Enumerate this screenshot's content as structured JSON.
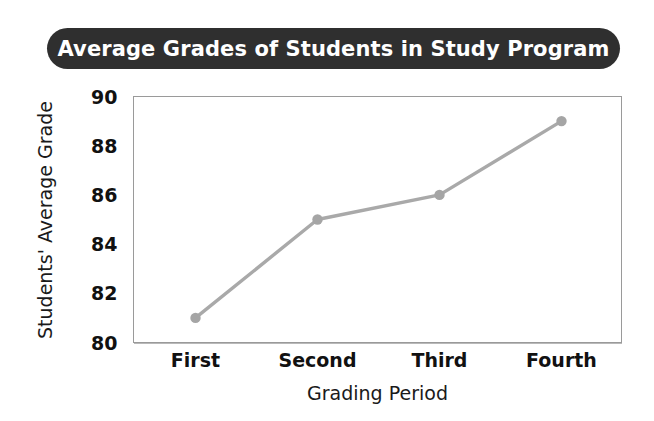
{
  "chart_data": {
    "type": "line",
    "title": "Average Grades of Students in Study Program",
    "xlabel": "Grading Period",
    "ylabel": "Students' Average Grade",
    "categories": [
      "First",
      "Second",
      "Third",
      "Fourth"
    ],
    "values": [
      81,
      85,
      86,
      89
    ],
    "series": [
      {
        "name": "Students' Average Grade",
        "values": [
          81,
          85,
          86,
          89
        ]
      }
    ],
    "ylim": [
      80,
      90
    ],
    "ytick_step": 2,
    "yticks": [
      80,
      82,
      84,
      86,
      88,
      90
    ],
    "ytick_labels": [
      "80",
      "82",
      "84",
      "86",
      "88",
      "90"
    ],
    "grid": true,
    "grid_axis": "both",
    "legend": false,
    "legend_position": "none",
    "markers": true,
    "colors": {
      "line": "#a9a9a9",
      "marker": "#a5a5a5",
      "grid": "#b9b9b9",
      "plot_border": "#9a9a9a",
      "title_banner": "#2f2f2f",
      "title_text": "#ffffff",
      "axis_text": "#111111",
      "background": "#ffffff"
    }
  }
}
